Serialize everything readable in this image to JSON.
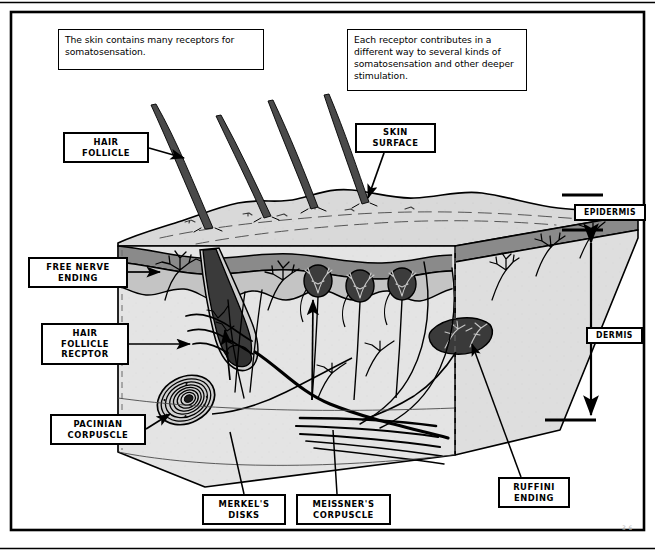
{
  "figure": {
    "corner_mark": "3-6"
  },
  "captions": [
    {
      "id": "skin-contains",
      "text": "The skin contains many receptors for somatosensation."
    },
    {
      "id": "each-receptor",
      "text": "Each receptor contributes in a different way to several kinds of somatosensation and other deeper stimulation."
    }
  ],
  "labels": {
    "hair_follicle": "HAIR\nFOLLICLE",
    "free_nerve_ending": "FREE NERVE\nENDING",
    "hair_follicle_receptor": "HAIR\nFOLLICLE\nRECPTOR",
    "pacinian_corpuscle": "PACINIAN\nCORPUSCLE",
    "skin_surface": "SKIN\nSURFACE",
    "epidermis": "EPIDERMIS",
    "dermis": "DERMIS",
    "merkels_disks": "MERKEL'S\nDISKS",
    "meissners_corpuscle": "MEISSNER'S\nCORPUSCLE",
    "ruffini_ending": "RUFFINI\nENDING"
  },
  "colors": {
    "ink": "#000000",
    "page": "#ffffff",
    "skin_surface_light": "#d8d8d8",
    "epidermis_band": "#8a8a8a",
    "subepidermis": "#c2c2c2",
    "dermis_fill": "#e2e2e2",
    "dermis_side": "#dcdcdc",
    "receptor_dark": "#3a3a3a",
    "hair_shaft": "#4a4a4a",
    "corner_mark": "#b9b9b9"
  },
  "structures": {
    "layers": [
      "skin surface",
      "epidermis",
      "dermis"
    ],
    "receptors": [
      "free nerve ending",
      "hair follicle receptor",
      "Merkel's disks",
      "Meissner's corpuscle",
      "Pacinian corpuscle",
      "Ruffini ending"
    ],
    "hair_count": 4,
    "meissner_corpuscle_count": 3
  }
}
